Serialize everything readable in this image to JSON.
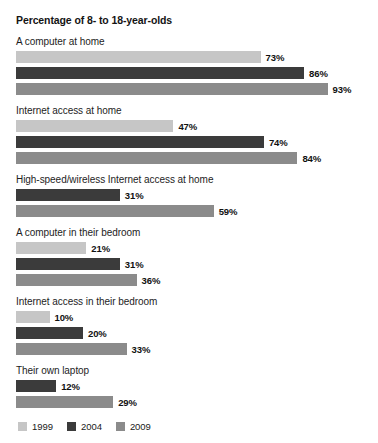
{
  "chart_data": {
    "type": "bar",
    "title": "Percentage of 8- to 18-year-olds",
    "xlabel": "",
    "ylabel": "",
    "orientation": "horizontal",
    "grid": false,
    "legend_position": "bottom-left",
    "xlim": [
      0,
      100
    ],
    "value_suffix": "%",
    "px_per_percent": 3.35,
    "categories": [
      "A computer at home",
      "Internet access at home",
      "High-speed/wireless Internet access at home",
      "A computer in their bedroom",
      "Internet access in their bedroom",
      "Their own laptop"
    ],
    "series": [
      {
        "name": "1999",
        "color": "#c6c6c6",
        "values": [
          73,
          47,
          null,
          21,
          10,
          null
        ]
      },
      {
        "name": "2004",
        "color": "#3b3b3b",
        "values": [
          86,
          74,
          31,
          31,
          20,
          12
        ]
      },
      {
        "name": "2009",
        "color": "#8b8b8b",
        "values": [
          93,
          84,
          59,
          36,
          33,
          29
        ]
      }
    ],
    "groups": [
      {
        "label": "A computer at home",
        "bars": [
          {
            "series": "1999",
            "value": 73,
            "value_label": "73%",
            "color": "#c6c6c6"
          },
          {
            "series": "2004",
            "value": 86,
            "value_label": "86%",
            "color": "#3b3b3b"
          },
          {
            "series": "2009",
            "value": 93,
            "value_label": "93%",
            "color": "#8b8b8b"
          }
        ]
      },
      {
        "label": "Internet access at home",
        "bars": [
          {
            "series": "1999",
            "value": 47,
            "value_label": "47%",
            "color": "#c6c6c6"
          },
          {
            "series": "2004",
            "value": 74,
            "value_label": "74%",
            "color": "#3b3b3b"
          },
          {
            "series": "2009",
            "value": 84,
            "value_label": "84%",
            "color": "#8b8b8b"
          }
        ]
      },
      {
        "label": "High-speed/wireless Internet access at home",
        "bars": [
          {
            "series": "2004",
            "value": 31,
            "value_label": "31%",
            "color": "#3b3b3b"
          },
          {
            "series": "2009",
            "value": 59,
            "value_label": "59%",
            "color": "#8b8b8b"
          }
        ]
      },
      {
        "label": "A computer in their bedroom",
        "bars": [
          {
            "series": "1999",
            "value": 21,
            "value_label": "21%",
            "color": "#c6c6c6"
          },
          {
            "series": "2004",
            "value": 31,
            "value_label": "31%",
            "color": "#3b3b3b"
          },
          {
            "series": "2009",
            "value": 36,
            "value_label": "36%",
            "color": "#8b8b8b"
          }
        ]
      },
      {
        "label": "Internet access in their bedroom",
        "bars": [
          {
            "series": "1999",
            "value": 10,
            "value_label": "10%",
            "color": "#c6c6c6"
          },
          {
            "series": "2004",
            "value": 20,
            "value_label": "20%",
            "color": "#3b3b3b"
          },
          {
            "series": "2009",
            "value": 33,
            "value_label": "33%",
            "color": "#8b8b8b"
          }
        ]
      },
      {
        "label": "Their own laptop",
        "bars": [
          {
            "series": "2004",
            "value": 12,
            "value_label": "12%",
            "color": "#3b3b3b"
          },
          {
            "series": "2009",
            "value": 29,
            "value_label": "29%",
            "color": "#8b8b8b"
          }
        ]
      }
    ],
    "legend": [
      {
        "label": "1999",
        "color": "#c6c6c6"
      },
      {
        "label": "2004",
        "color": "#3b3b3b"
      },
      {
        "label": "2009",
        "color": "#8b8b8b"
      }
    ]
  }
}
